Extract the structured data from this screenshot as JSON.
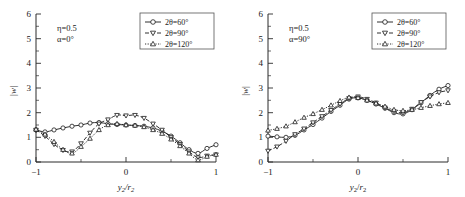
{
  "figure": {
    "panel_count": 2
  },
  "chart_data": [
    {
      "type": "line",
      "panel": "left",
      "title": "",
      "xlabel": "y2/r2",
      "ylabel": "|w|",
      "xlim": [
        -1,
        1
      ],
      "ylim": [
        0,
        6
      ],
      "xticks": [
        -1,
        0,
        1
      ],
      "xticklabels": [
        "−1",
        "0",
        "1"
      ],
      "yticks": [
        0,
        1,
        2,
        3,
        4,
        5,
        6
      ],
      "yticklabels": [
        "0",
        "1",
        "2",
        "3",
        "4",
        "5",
        "6"
      ],
      "grid": false,
      "legend_position": "top-right",
      "annotations": [
        "η=0.5",
        "α=0°"
      ],
      "annotation_eta": "η=0.5",
      "annotation_alpha": "α=0°",
      "series": [
        {
          "name": "2θ=60°",
          "marker": "circle",
          "linestyle": "solid",
          "x": [
            -1.0,
            -0.9,
            -0.8,
            -0.7,
            -0.6,
            -0.5,
            -0.4,
            -0.3,
            -0.2,
            -0.1,
            0.0,
            0.1,
            0.2,
            0.3,
            0.4,
            0.5,
            0.6,
            0.7,
            0.8,
            0.9,
            1.0
          ],
          "values": [
            1.3,
            1.22,
            1.3,
            1.38,
            1.45,
            1.5,
            1.58,
            1.6,
            1.55,
            1.52,
            1.5,
            1.48,
            1.45,
            1.38,
            1.25,
            1.05,
            0.78,
            0.5,
            0.35,
            0.55,
            0.7
          ]
        },
        {
          "name": "2θ=90°",
          "marker": "triangle-down",
          "linestyle": "dashed",
          "x": [
            -1.0,
            -0.9,
            -0.8,
            -0.7,
            -0.6,
            -0.5,
            -0.4,
            -0.3,
            -0.2,
            -0.1,
            0.0,
            0.1,
            0.2,
            0.3,
            0.4,
            0.5,
            0.6,
            0.7,
            0.8,
            0.9,
            1.0
          ],
          "values": [
            1.3,
            1.05,
            0.72,
            0.48,
            0.42,
            0.75,
            1.18,
            1.55,
            1.72,
            1.9,
            1.88,
            1.9,
            1.78,
            1.55,
            1.3,
            1.0,
            0.72,
            0.42,
            0.18,
            0.25,
            0.3
          ]
        },
        {
          "name": "2θ=120°",
          "marker": "triangle-up",
          "linestyle": "dotted",
          "x": [
            -1.0,
            -0.9,
            -0.8,
            -0.7,
            -0.6,
            -0.5,
            -0.4,
            -0.3,
            -0.2,
            -0.1,
            0.0,
            0.1,
            0.2,
            0.3,
            0.4,
            0.5,
            0.6,
            0.7,
            0.8,
            0.9,
            1.0
          ],
          "values": [
            1.32,
            1.12,
            0.82,
            0.5,
            0.35,
            0.62,
            0.95,
            1.3,
            1.5,
            1.55,
            1.5,
            1.48,
            1.42,
            1.3,
            1.15,
            0.92,
            0.65,
            0.35,
            0.08,
            0.22,
            0.3
          ]
        }
      ]
    },
    {
      "type": "line",
      "panel": "right",
      "title": "",
      "xlabel": "y2/r2",
      "ylabel": "|w|",
      "xlim": [
        -1,
        1
      ],
      "ylim": [
        0,
        6
      ],
      "xticks": [
        -1,
        0,
        1
      ],
      "xticklabels": [
        "−1",
        "0",
        "1"
      ],
      "yticks": [
        0,
        1,
        2,
        3,
        4,
        5,
        6
      ],
      "yticklabels": [
        "0",
        "1",
        "2",
        "3",
        "4",
        "5",
        "6"
      ],
      "grid": false,
      "legend_position": "top-right",
      "annotations": [
        "η=0.5",
        "α=90°"
      ],
      "annotation_eta": "η=0.5",
      "annotation_alpha": "α=90°",
      "series": [
        {
          "name": "2θ=60°",
          "marker": "circle",
          "linestyle": "solid",
          "x": [
            -1.0,
            -0.9,
            -0.8,
            -0.7,
            -0.6,
            -0.5,
            -0.4,
            -0.3,
            -0.2,
            -0.1,
            0.0,
            0.1,
            0.2,
            0.3,
            0.4,
            0.5,
            0.6,
            0.7,
            0.8,
            0.9,
            1.0
          ],
          "values": [
            1.05,
            1.02,
            1.0,
            1.08,
            1.3,
            1.52,
            1.78,
            2.05,
            2.3,
            2.55,
            2.6,
            2.5,
            2.35,
            2.18,
            2.0,
            1.95,
            2.12,
            2.4,
            2.7,
            2.95,
            3.1
          ]
        },
        {
          "name": "2θ=90°",
          "marker": "triangle-down",
          "linestyle": "dashed",
          "x": [
            -1.0,
            -0.9,
            -0.8,
            -0.7,
            -0.6,
            -0.5,
            -0.4,
            -0.3,
            -0.2,
            -0.1,
            0.0,
            0.1,
            0.2,
            0.3,
            0.4,
            0.5,
            0.6,
            0.7,
            0.8,
            0.9,
            1.0
          ],
          "values": [
            0.45,
            0.62,
            0.85,
            1.12,
            1.35,
            1.6,
            1.85,
            2.1,
            2.35,
            2.58,
            2.65,
            2.55,
            2.4,
            2.2,
            2.05,
            2.0,
            2.15,
            2.42,
            2.65,
            2.82,
            2.9
          ]
        },
        {
          "name": "2θ=120°",
          "marker": "triangle-up",
          "linestyle": "dotted",
          "x": [
            -1.0,
            -0.9,
            -0.8,
            -0.7,
            -0.6,
            -0.5,
            -0.4,
            -0.3,
            -0.2,
            -0.1,
            0.0,
            0.1,
            0.2,
            0.3,
            0.4,
            0.5,
            0.6,
            0.7,
            0.8,
            0.9,
            1.0
          ],
          "values": [
            1.28,
            1.35,
            1.45,
            1.62,
            1.8,
            1.95,
            2.12,
            2.3,
            2.48,
            2.62,
            2.6,
            2.5,
            2.38,
            2.25,
            2.12,
            2.08,
            2.12,
            2.2,
            2.28,
            2.35,
            2.4
          ]
        }
      ]
    }
  ]
}
